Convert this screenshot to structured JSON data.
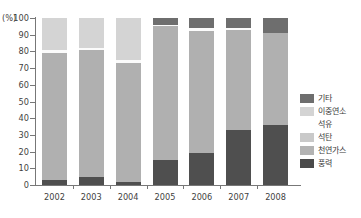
{
  "chart_data": {
    "type": "bar",
    "stacked": true,
    "title": "",
    "subtitle": "",
    "xlabel": "",
    "ylabel": "(%)",
    "unit_label": "(%)",
    "ylim": [
      0,
      100
    ],
    "ytick_labels": [
      "0",
      "10",
      "20",
      "30",
      "40",
      "50",
      "60",
      "70",
      "80",
      "90",
      "100"
    ],
    "ytick_values": [
      0,
      10,
      20,
      30,
      40,
      50,
      60,
      70,
      80,
      90,
      100
    ],
    "grid": false,
    "legend_position": "right",
    "categories": [
      "2002",
      "2003",
      "2004",
      "2005",
      "2006",
      "2007",
      "2008"
    ],
    "series": [
      {
        "name": "기타",
        "color": "#6e6e6e",
        "values": [
          0,
          0,
          0,
          4,
          6,
          6,
          9
        ]
      },
      {
        "name": "이중연소",
        "color": "#d4d4d4",
        "values": [
          19,
          18,
          25,
          0,
          0,
          0,
          0
        ]
      },
      {
        "name": "석유",
        "color": "#f7f7f7",
        "values": [
          2,
          1,
          2,
          1,
          2,
          1,
          0
        ]
      },
      {
        "name": "석탄",
        "color": "#c9c9c9",
        "values": [
          0,
          0,
          0,
          0,
          0,
          0,
          0
        ]
      },
      {
        "name": "천연가스",
        "color": "#b0b0b0",
        "values": [
          76,
          76,
          71,
          80,
          73,
          60,
          55
        ]
      },
      {
        "name": "풍력",
        "color": "#4f4f4f",
        "values": [
          3,
          5,
          2,
          15,
          19,
          33,
          36
        ]
      }
    ],
    "bars": [
      {
        "year": "2002",
        "segments": [
          {
            "series": "풍력",
            "from": 0,
            "to": 3,
            "color": "#4f4f4f"
          },
          {
            "series": "천연가스",
            "from": 3,
            "to": 79,
            "color": "#b0b0b0"
          },
          {
            "series": "석유",
            "from": 79,
            "to": 81,
            "color": "#fbfbfb"
          },
          {
            "series": "이중연소",
            "from": 81,
            "to": 100,
            "color": "#d4d4d4"
          }
        ]
      },
      {
        "year": "2003",
        "segments": [
          {
            "series": "풍력",
            "from": 0,
            "to": 5,
            "color": "#4f4f4f"
          },
          {
            "series": "천연가스",
            "from": 5,
            "to": 81,
            "color": "#b0b0b0"
          },
          {
            "series": "석유",
            "from": 81,
            "to": 82,
            "color": "#fbfbfb"
          },
          {
            "series": "이중연소",
            "from": 82,
            "to": 100,
            "color": "#d4d4d4"
          }
        ]
      },
      {
        "year": "2004",
        "segments": [
          {
            "series": "풍력",
            "from": 0,
            "to": 2,
            "color": "#4f4f4f"
          },
          {
            "series": "천연가스",
            "from": 2,
            "to": 73,
            "color": "#b0b0b0"
          },
          {
            "series": "석유",
            "from": 73,
            "to": 75,
            "color": "#fbfbfb"
          },
          {
            "series": "이중연소",
            "from": 75,
            "to": 100,
            "color": "#d4d4d4"
          }
        ]
      },
      {
        "year": "2005",
        "segments": [
          {
            "series": "풍력",
            "from": 0,
            "to": 15,
            "color": "#4f4f4f"
          },
          {
            "series": "천연가스",
            "from": 15,
            "to": 95,
            "color": "#b0b0b0"
          },
          {
            "series": "석유",
            "from": 95,
            "to": 96,
            "color": "#fbfbfb"
          },
          {
            "series": "기타",
            "from": 96,
            "to": 100,
            "color": "#6e6e6e"
          }
        ]
      },
      {
        "year": "2006",
        "segments": [
          {
            "series": "풍력",
            "from": 0,
            "to": 19,
            "color": "#4f4f4f"
          },
          {
            "series": "천연가스",
            "from": 19,
            "to": 92,
            "color": "#b0b0b0"
          },
          {
            "series": "석유",
            "from": 92,
            "to": 94,
            "color": "#fbfbfb"
          },
          {
            "series": "기타",
            "from": 94,
            "to": 100,
            "color": "#6e6e6e"
          }
        ]
      },
      {
        "year": "2007",
        "segments": [
          {
            "series": "풍력",
            "from": 0,
            "to": 33,
            "color": "#4f4f4f"
          },
          {
            "series": "천연가스",
            "from": 33,
            "to": 93,
            "color": "#b0b0b0"
          },
          {
            "series": "석유",
            "from": 93,
            "to": 94,
            "color": "#fbfbfb"
          },
          {
            "series": "기타",
            "from": 94,
            "to": 100,
            "color": "#6e6e6e"
          }
        ]
      },
      {
        "year": "2008",
        "segments": [
          {
            "series": "풍력",
            "from": 0,
            "to": 36,
            "color": "#4f4f4f"
          },
          {
            "series": "천연가스",
            "from": 36,
            "to": 91,
            "color": "#b0b0b0"
          },
          {
            "series": "기타",
            "from": 91,
            "to": 100,
            "color": "#6e6e6e"
          }
        ]
      }
    ],
    "legend": [
      {
        "label": "기타",
        "color": "#6e6e6e"
      },
      {
        "label": "이중연소",
        "color": "#d4d4d4"
      },
      {
        "label": "석유",
        "color": "#fbfbfb"
      },
      {
        "label": "석탄",
        "color": "#c9c9c9"
      },
      {
        "label": "천연가스",
        "color": "#b3b3b3"
      },
      {
        "label": "풍력",
        "color": "#4a4a4a"
      }
    ]
  },
  "colors": {
    "axis": "#777777",
    "text": "#3a3a3a",
    "background": "#ffffff"
  }
}
